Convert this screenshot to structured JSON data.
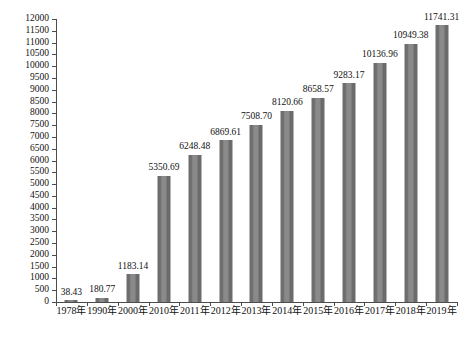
{
  "chart_data": {
    "type": "bar",
    "title": "",
    "xlabel": "",
    "ylabel": "",
    "ylim": [
      0,
      12000
    ],
    "ytick_step": 500,
    "grid": false,
    "legend": "none",
    "bar_color": "#7d7d7d",
    "axis_color": "#4c4c4c",
    "background": "#ffffff",
    "categories": [
      "1978年",
      "1990年",
      "2000年",
      "2010年",
      "2011年",
      "2012年",
      "2013年",
      "2014年",
      "2015年",
      "2016年",
      "2017年",
      "2018年",
      "2019年"
    ],
    "values": [
      38.43,
      180.77,
      1183.14,
      5350.69,
      6248.48,
      6869.61,
      7508.7,
      8120.66,
      8658.57,
      9283.17,
      10136.96,
      10949.38,
      11741.31
    ],
    "data_labels": [
      "38.43",
      "180.77",
      "1183.14",
      "5350.69",
      "6248.48",
      "6869.61",
      "7508.70",
      "8120.66",
      "8658.57",
      "9283.17",
      "10136.96",
      "10949.38",
      "11741.31"
    ],
    "ytick_labels": [
      "0",
      "500",
      "1000",
      "1500",
      "2000",
      "2500",
      "3000",
      "3500",
      "4000",
      "4500",
      "5000",
      "5500",
      "6000",
      "6500",
      "7000",
      "7500",
      "8000",
      "8500",
      "9000",
      "9500",
      "10000",
      "10500",
      "11000",
      "11500",
      "12000"
    ]
  }
}
